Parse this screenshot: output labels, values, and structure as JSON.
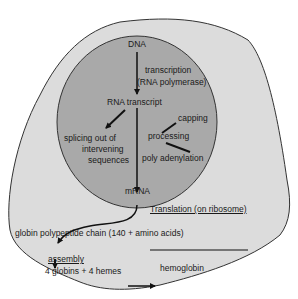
{
  "diagram": {
    "colors": {
      "cell_fill": "#dcdcdc",
      "nucleus_fill": "#a9a9a9",
      "outline": "#333333",
      "background": "#ffffff"
    },
    "nodes": {
      "dna": "DNA",
      "transcription": "transcription",
      "rna_polymerase": "(RNA polymerase)",
      "rna_transcript": "RNA transcript",
      "capping": "capping",
      "processing": "processing",
      "poly_adenylation": "poly adenylation",
      "splicing_1": "splicing out of",
      "splicing_2": "intervening",
      "splicing_3": "sequences",
      "mrna": "mRNA",
      "translation": "Translation (on ribosome)",
      "globin_chain": "globin polypeptide chain (140 + amino acids)",
      "assembly": "assembly",
      "globins_hemes": "4 globins + 4  hemes",
      "hemoglobin": "hemoglobin"
    },
    "edges": [
      {
        "from": "DNA",
        "to": "RNA transcript",
        "label": "transcription (RNA polymerase)"
      },
      {
        "from": "RNA transcript",
        "to": "splicing out of intervening sequences"
      },
      {
        "from": "RNA transcript",
        "to": "mRNA"
      },
      {
        "from": "processing",
        "to": "capping"
      },
      {
        "from": "processing",
        "to": "poly adenylation"
      },
      {
        "from": "mRNA",
        "to": "globin polypeptide chain",
        "label": "Translation (on ribosome)"
      },
      {
        "from": "globin polypeptide chain",
        "to": "assembly"
      },
      {
        "from": "4 globins + 4 hemes",
        "to": "hemoglobin"
      }
    ]
  }
}
